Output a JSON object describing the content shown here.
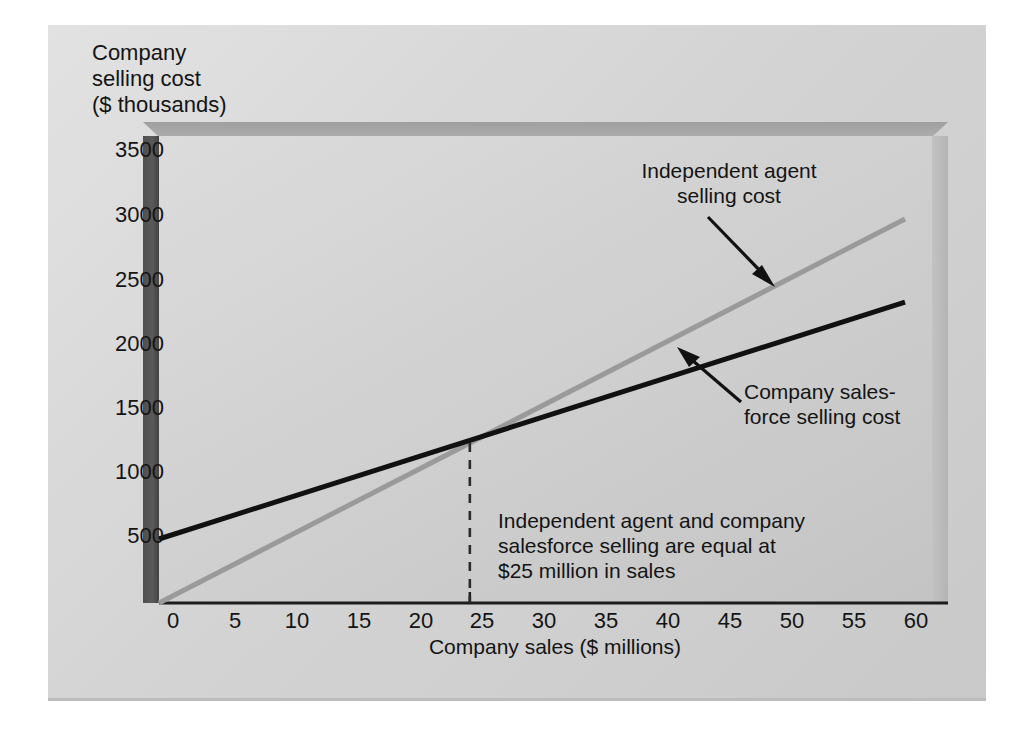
{
  "chart_data": {
    "type": "line",
    "title": "",
    "subtitle": "",
    "xlabel": "Company sales ($ millions)",
    "ylabel": "Company\nselling cost\n($ thousands)",
    "xlim": [
      0,
      60
    ],
    "ylim": [
      0,
      3500
    ],
    "xticks": [
      "0",
      "5",
      "10",
      "15",
      "20",
      "25",
      "30",
      "35",
      "40",
      "45",
      "50",
      "55",
      "60"
    ],
    "yticks": [
      "500",
      "1000",
      "1500",
      "2000",
      "2500",
      "3000",
      "3500"
    ],
    "xtick_values": [
      0,
      5,
      10,
      15,
      20,
      25,
      30,
      35,
      40,
      45,
      50,
      55,
      60
    ],
    "ytick_values": [
      500,
      1000,
      1500,
      2000,
      2500,
      3000,
      3500
    ],
    "grid": false,
    "legend_position": "inline-annotations",
    "series": [
      {
        "name": "Independent agent selling cost",
        "color": "#9a9a9a",
        "x": [
          0,
          60
        ],
        "values": [
          0,
          3000
        ],
        "line_width": 5
      },
      {
        "name": "Company salesforce selling cost",
        "color": "#111111",
        "x": [
          0,
          60
        ],
        "values": [
          500,
          2350
        ],
        "line_width": 5
      }
    ],
    "intersection": {
      "x": 25,
      "y": 1250
    },
    "annotations": [
      {
        "id": "agent-label",
        "text": "Independent agent\nselling cost",
        "target_series": "Independent agent selling cost",
        "arrow": true
      },
      {
        "id": "salesforce-label",
        "text": "Company sales-\nforce selling cost",
        "target_series": "Company salesforce selling cost",
        "arrow": true
      },
      {
        "id": "breakeven-note",
        "text": "Independent agent and company\nsalesforce selling are equal at\n$25 million in sales",
        "arrow": false
      }
    ],
    "reference_line": {
      "id": "breakeven-dashed",
      "orientation": "vertical",
      "x": 25,
      "style": "dashed",
      "color": "#2b2b2b",
      "from_y": 0,
      "to_y": 1250
    },
    "colors": {
      "agent_line": "#9a9a9a",
      "salesforce_line": "#111111",
      "plot_background": "#d4d4d4",
      "panel_background": "#d9d9d9",
      "axis": "#1d1d1d",
      "text": "#141414"
    }
  }
}
